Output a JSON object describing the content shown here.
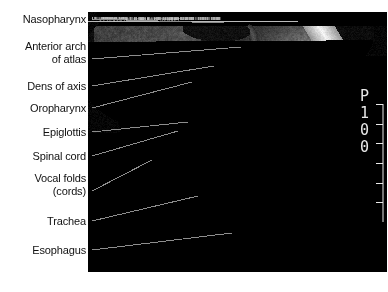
{
  "figure": {
    "kind": "labeled-anatomical-mri",
    "modality": "MRI",
    "view": "midsagittal cervical spine and neck",
    "width": 388,
    "height": 292,
    "background_color": "#ffffff"
  },
  "labels": [
    {
      "id": "nasopharynx",
      "line1": "Nasopharynx",
      "line2": "",
      "text_right": 86,
      "text_top": 13,
      "leader": {
        "x1": 92,
        "y1": 19,
        "x2": 224,
        "y2": 23
      }
    },
    {
      "id": "anterior-arch",
      "line1": "Anterior arch",
      "line2": "of atlas",
      "text_right": 86,
      "text_top": 40,
      "leader": {
        "x1": 92,
        "y1": 59,
        "x2": 241,
        "y2": 47
      }
    },
    {
      "id": "dens-of-axis",
      "line1": "Dens of axis",
      "line2": "",
      "text_right": 86,
      "text_top": 80,
      "leader": {
        "x1": 92,
        "y1": 86,
        "x2": 214,
        "y2": 66
      }
    },
    {
      "id": "oropharynx",
      "line1": "Oropharynx",
      "line2": "",
      "text_right": 86,
      "text_top": 102,
      "leader": {
        "x1": 92,
        "y1": 108,
        "x2": 192,
        "y2": 82
      }
    },
    {
      "id": "epiglottis",
      "line1": "Epiglottis",
      "line2": "",
      "text_right": 86,
      "text_top": 126,
      "leader": {
        "x1": 92,
        "y1": 132,
        "x2": 188,
        "y2": 122
      }
    },
    {
      "id": "spinal-cord",
      "line1": "Spinal cord",
      "line2": "",
      "text_right": 86,
      "text_top": 150,
      "leader": {
        "x1": 92,
        "y1": 156,
        "x2": 178,
        "y2": 131
      }
    },
    {
      "id": "vocal-folds",
      "line1": "Vocal folds",
      "line2": "(cords)",
      "text_right": 86,
      "text_top": 172,
      "leader": {
        "x1": 92,
        "y1": 191,
        "x2": 152,
        "y2": 160
      }
    },
    {
      "id": "trachea",
      "line1": "Trachea",
      "line2": "",
      "text_right": 86,
      "text_top": 215,
      "leader": {
        "x1": 92,
        "y1": 221,
        "x2": 198,
        "y2": 196
      }
    },
    {
      "id": "esophagus",
      "line1": "Esophagus",
      "line2": "",
      "text_right": 86,
      "text_top": 244,
      "leader": {
        "x1": 92,
        "y1": 250,
        "x2": 232,
        "y2": 233
      }
    }
  ],
  "leader_line": {
    "color": "#8d8d8d",
    "width": 1
  },
  "dicom_overlay": {
    "characters": [
      "P",
      "1",
      "0",
      "0"
    ],
    "color": "#e9e9e9",
    "orientation": "vertical",
    "tick_count": 7
  },
  "scanner_text": {
    "value": "··illegible scanner header··"
  },
  "chart_data": {
    "type": "heatmap",
    "note": "grayscale anatomical image; no numeric axes"
  }
}
